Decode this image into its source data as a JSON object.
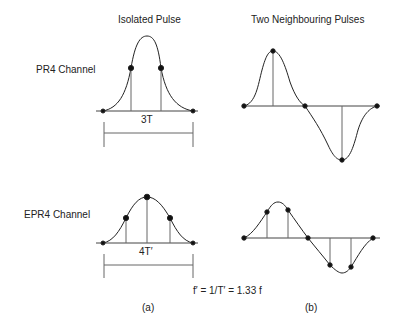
{
  "titles": {
    "left": "Isolated Pulse",
    "right": "Two Neighbouring Pulses"
  },
  "rows": {
    "top": "PR4 Channel",
    "bottom": "EPR4 Channel"
  },
  "dimensions": {
    "pr4": "3T",
    "epr4": "4T′"
  },
  "formula": "f′ = 1/T′ = 1.33 f",
  "panels": {
    "a": "(a)",
    "b": "(b)"
  },
  "colors": {
    "line": "#222222",
    "stem": "#555555",
    "background": "#ffffff"
  }
}
